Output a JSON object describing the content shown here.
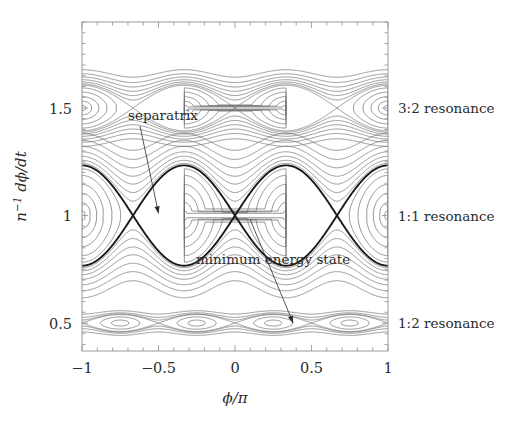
{
  "figure": {
    "kind": "phase-space-contour-plot",
    "background_color": "#ffffff",
    "frame_color": "#9a9a9a",
    "contour_color": "#6e6e6e",
    "separatrix_color": "#1a1a1a",
    "annotation_color": "#2b2b2b"
  },
  "axes": {
    "x": {
      "label": "ϕ/π",
      "label_parts": {
        "num": "ϕ",
        "den": "π"
      },
      "min": -1,
      "max": 1,
      "ticks": [
        -1,
        -0.5,
        0,
        0.5,
        1
      ],
      "tick_labels": [
        "−1",
        "−0.5",
        "0",
        "0.5",
        "1"
      ],
      "minor_tick_step": 0.1
    },
    "y": {
      "label": "n⁻¹ dϕ/dt",
      "label_parts": {
        "base": "n",
        "exp": "−1",
        "num": "dϕ",
        "den": "dt"
      },
      "min": 0.37,
      "max": 1.9,
      "ticks": [
        0.5,
        1,
        1.5
      ],
      "tick_labels": [
        "0.5",
        "1",
        "1.5"
      ],
      "minor_tick_step": 0.05
    }
  },
  "side_labels": [
    {
      "name": "label-3-2-resonance",
      "text": "3:2 resonance",
      "y_value": 1.5
    },
    {
      "name": "label-1-1-resonance",
      "text": "1:1 resonance",
      "y_value": 1.0
    },
    {
      "name": "label-1-2-resonance",
      "text": "1:2 resonance",
      "y_value": 0.5
    }
  ],
  "annotations": [
    {
      "name": "annotation-separatrix",
      "text": "separatrix",
      "text_x": 0.0,
      "text_y": 0.0,
      "arrow_from": [
        -0.74,
        1.3
      ],
      "arrow_to": [
        -0.5,
        1.01
      ]
    },
    {
      "name": "annotation-minimum-energy-state",
      "text": "minimum energy state",
      "text_x": 0.0,
      "text_y": 0.0,
      "arrow_from": [
        0.06,
        1.0
      ],
      "arrow_to": [
        0.38,
        0.5
      ]
    }
  ],
  "chart_data": {
    "type": "line",
    "title": "",
    "xlabel": "ϕ/π",
    "ylabel": "n⁻¹ dϕ/dt",
    "xlim": [
      -1,
      1
    ],
    "ylim": [
      0.37,
      1.9
    ],
    "grid": false,
    "legend": "none",
    "resonances": [
      {
        "name": "3:2 resonance",
        "center_y": 1.5,
        "order": 2,
        "half_width": 0.075,
        "island_centers_x": [
          -1.0,
          0.0,
          1.0
        ],
        "x_point_x": [
          -0.5,
          0.5
        ],
        "separatrix_bold": false,
        "inner_levels": [
          0.12,
          0.3,
          0.5,
          0.7,
          0.88
        ],
        "outer_levels": [
          1.06,
          1.14,
          1.24,
          1.36,
          1.5,
          1.68
        ]
      },
      {
        "name": "1:1 resonance",
        "center_y": 1.0,
        "order": 2,
        "half_width": 0.165,
        "island_centers_x": [
          -1.0,
          0.0,
          1.0
        ],
        "x_point_x": [
          -0.5,
          0.5
        ],
        "separatrix_bold": true,
        "inner_levels": [
          0.1,
          0.26,
          0.44,
          0.62,
          0.8,
          0.93
        ],
        "outer_levels": [
          1.04,
          1.1,
          1.18,
          1.27,
          1.38,
          1.5,
          1.64
        ]
      },
      {
        "name": "1:2 resonance",
        "center_y": 0.5,
        "order": 4,
        "half_width": 0.028,
        "island_centers_x": [
          -0.75,
          -0.25,
          0.25,
          0.75
        ],
        "x_point_x": [
          -1.0,
          -0.5,
          0.0,
          0.5,
          1.0
        ],
        "separatrix_bold": false,
        "inner_levels": [
          0.35,
          0.72
        ],
        "outer_levels": [
          1.06,
          1.2,
          1.45
        ]
      }
    ]
  }
}
